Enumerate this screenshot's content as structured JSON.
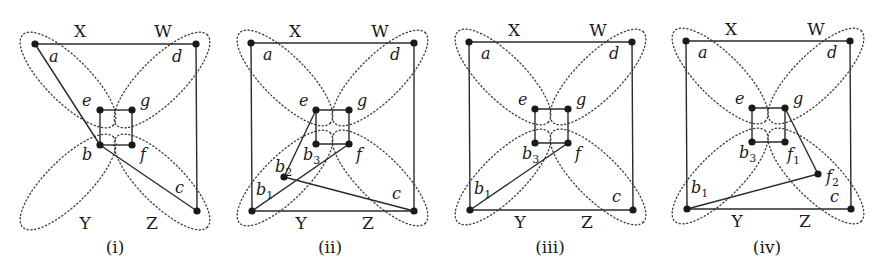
{
  "figure": {
    "panels": [
      {
        "id": "i",
        "caption": "(i)",
        "caption_pos": [
          115,
          253
        ],
        "regions": [
          {
            "label": "X",
            "pos": [
              80,
              37
            ]
          },
          {
            "label": "W",
            "pos": [
              163,
              37
            ]
          },
          {
            "label": "Y",
            "pos": [
              85,
              229
            ]
          },
          {
            "label": "Z",
            "pos": [
              152,
              229
            ]
          }
        ],
        "ellipses": [
          {
            "name": "X",
            "cx": 68,
            "cy": 80,
            "rx": 64,
            "ry": 22,
            "rot": 45
          },
          {
            "name": "W",
            "cx": 162,
            "cy": 80,
            "rx": 64,
            "ry": 22,
            "rot": -45
          },
          {
            "name": "Y",
            "cx": 68,
            "cy": 182,
            "rx": 64,
            "ry": 22,
            "rot": -45
          },
          {
            "name": "Z",
            "cx": 162,
            "cy": 182,
            "rx": 64,
            "ry": 22,
            "rot": 45
          }
        ],
        "vertices": [
          {
            "id": "a",
            "x": 35,
            "y": 44,
            "label": "a",
            "sub": "",
            "lx": 49,
            "ly": 62
          },
          {
            "id": "d",
            "x": 196,
            "y": 44,
            "label": "d",
            "sub": "",
            "lx": 172,
            "ly": 62
          },
          {
            "id": "e",
            "x": 100,
            "y": 110,
            "label": "e",
            "sub": "",
            "lx": 82,
            "ly": 106
          },
          {
            "id": "g",
            "x": 132,
            "y": 110,
            "label": "g",
            "sub": "",
            "lx": 140,
            "ly": 106
          },
          {
            "id": "b",
            "x": 100,
            "y": 145,
            "label": "b",
            "sub": "",
            "lx": 82,
            "ly": 160
          },
          {
            "id": "f",
            "x": 132,
            "y": 145,
            "label": "f",
            "sub": "",
            "lx": 140,
            "ly": 160
          },
          {
            "id": "c",
            "x": 197,
            "y": 211,
            "label": "c",
            "sub": "",
            "lx": 175,
            "ly": 193
          }
        ],
        "edges": [
          [
            "a",
            "d"
          ],
          [
            "d",
            "c"
          ],
          [
            "a",
            "b"
          ],
          [
            "b",
            "c"
          ],
          [
            "e",
            "g"
          ],
          [
            "g",
            "f"
          ],
          [
            "f",
            "b"
          ],
          [
            "b",
            "e"
          ]
        ]
      },
      {
        "id": "ii",
        "caption": "(ii)",
        "caption_pos": [
          330,
          253
        ],
        "regions": [
          {
            "label": "X",
            "pos": [
              295,
              37
            ]
          },
          {
            "label": "W",
            "pos": [
              380,
              37
            ]
          },
          {
            "label": "Y",
            "pos": [
              301,
              229
            ]
          },
          {
            "label": "Z",
            "pos": [
              368,
              229
            ]
          }
        ],
        "ellipses": [
          {
            "name": "X",
            "cx": 285,
            "cy": 78,
            "rx": 64,
            "ry": 22,
            "rot": 45
          },
          {
            "name": "W",
            "cx": 380,
            "cy": 78,
            "rx": 64,
            "ry": 22,
            "rot": -45
          },
          {
            "name": "Y",
            "cx": 285,
            "cy": 178,
            "rx": 64,
            "ry": 22,
            "rot": -45
          },
          {
            "name": "Z",
            "cx": 380,
            "cy": 178,
            "rx": 64,
            "ry": 22,
            "rot": 45
          }
        ],
        "vertices": [
          {
            "id": "a",
            "x": 251,
            "y": 43,
            "label": "a",
            "sub": "",
            "lx": 263,
            "ly": 60
          },
          {
            "id": "d",
            "x": 414,
            "y": 43,
            "label": "d",
            "sub": "",
            "lx": 390,
            "ly": 60
          },
          {
            "id": "e",
            "x": 316,
            "y": 110,
            "label": "e",
            "sub": "",
            "lx": 299,
            "ly": 106
          },
          {
            "id": "g",
            "x": 349,
            "y": 110,
            "label": "g",
            "sub": "",
            "lx": 357,
            "ly": 106
          },
          {
            "id": "b3",
            "x": 316,
            "y": 144,
            "label": "b",
            "sub": "3",
            "lx": 303,
            "ly": 160
          },
          {
            "id": "f",
            "x": 349,
            "y": 144,
            "label": "f",
            "sub": "",
            "lx": 356,
            "ly": 160
          },
          {
            "id": "b2",
            "x": 284,
            "y": 177,
            "label": "b",
            "sub": "2",
            "lx": 275,
            "ly": 172
          },
          {
            "id": "b1",
            "x": 252,
            "y": 211,
            "label": "b",
            "sub": "1",
            "lx": 256,
            "ly": 195
          },
          {
            "id": "c",
            "x": 414,
            "y": 211,
            "label": "c",
            "sub": "",
            "lx": 392,
            "ly": 199
          }
        ],
        "edges": [
          [
            "a",
            "d"
          ],
          [
            "d",
            "c"
          ],
          [
            "a",
            "b1"
          ],
          [
            "b1",
            "c"
          ],
          [
            "e",
            "g"
          ],
          [
            "g",
            "f"
          ],
          [
            "f",
            "b3"
          ],
          [
            "b3",
            "e"
          ],
          [
            "e",
            "b2"
          ],
          [
            "b2",
            "c"
          ],
          [
            "b1",
            "f"
          ]
        ]
      },
      {
        "id": "iii",
        "caption": "(iii)",
        "caption_pos": [
          550,
          253
        ],
        "regions": [
          {
            "label": "X",
            "pos": [
              514,
              36
            ]
          },
          {
            "label": "W",
            "pos": [
              598,
              36
            ]
          },
          {
            "label": "Y",
            "pos": [
              520,
              228
            ]
          },
          {
            "label": "Z",
            "pos": [
              587,
              228
            ]
          }
        ],
        "ellipses": [
          {
            "name": "X",
            "cx": 503,
            "cy": 77,
            "rx": 64,
            "ry": 22,
            "rot": 45
          },
          {
            "name": "W",
            "cx": 598,
            "cy": 77,
            "rx": 64,
            "ry": 22,
            "rot": -45
          },
          {
            "name": "Y",
            "cx": 503,
            "cy": 177,
            "rx": 64,
            "ry": 22,
            "rot": -45
          },
          {
            "name": "Z",
            "cx": 598,
            "cy": 177,
            "rx": 64,
            "ry": 22,
            "rot": 45
          }
        ],
        "vertices": [
          {
            "id": "a",
            "x": 469,
            "y": 42,
            "label": "a",
            "sub": "",
            "lx": 481,
            "ly": 59
          },
          {
            "id": "d",
            "x": 632,
            "y": 42,
            "label": "d",
            "sub": "",
            "lx": 609,
            "ly": 59
          },
          {
            "id": "e",
            "x": 535,
            "y": 109,
            "label": "e",
            "sub": "",
            "lx": 518,
            "ly": 105
          },
          {
            "id": "g",
            "x": 568,
            "y": 109,
            "label": "g",
            "sub": "",
            "lx": 576,
            "ly": 105
          },
          {
            "id": "b3",
            "x": 535,
            "y": 143,
            "label": "b",
            "sub": "3",
            "lx": 522,
            "ly": 159
          },
          {
            "id": "f",
            "x": 568,
            "y": 143,
            "label": "f",
            "sub": "",
            "lx": 575,
            "ly": 159
          },
          {
            "id": "b1",
            "x": 470,
            "y": 210,
            "label": "b",
            "sub": "1",
            "lx": 474,
            "ly": 194
          },
          {
            "id": "c",
            "x": 633,
            "y": 210,
            "label": "c",
            "sub": "",
            "lx": 612,
            "ly": 202
          }
        ],
        "edges": [
          [
            "a",
            "d"
          ],
          [
            "d",
            "c"
          ],
          [
            "a",
            "b1"
          ],
          [
            "b1",
            "c"
          ],
          [
            "e",
            "g"
          ],
          [
            "g",
            "f"
          ],
          [
            "f",
            "b3"
          ],
          [
            "b3",
            "e"
          ],
          [
            "b1",
            "f"
          ]
        ]
      },
      {
        "id": "iv",
        "caption": "(iv)",
        "caption_pos": [
          767,
          253
        ],
        "regions": [
          {
            "label": "X",
            "pos": [
              731,
              35
            ]
          },
          {
            "label": "W",
            "pos": [
              816,
              35
            ]
          },
          {
            "label": "Y",
            "pos": [
              737,
              227
            ]
          },
          {
            "label": "Z",
            "pos": [
              805,
              227
            ]
          }
        ],
        "ellipses": [
          {
            "name": "X",
            "cx": 720,
            "cy": 76,
            "rx": 64,
            "ry": 22,
            "rot": 45
          },
          {
            "name": "W",
            "cx": 816,
            "cy": 76,
            "rx": 64,
            "ry": 22,
            "rot": -45
          },
          {
            "name": "Y",
            "cx": 720,
            "cy": 176,
            "rx": 64,
            "ry": 22,
            "rot": -45
          },
          {
            "name": "Z",
            "cx": 816,
            "cy": 176,
            "rx": 64,
            "ry": 22,
            "rot": 45
          }
        ],
        "vertices": [
          {
            "id": "a",
            "x": 686,
            "y": 41,
            "label": "a",
            "sub": "",
            "lx": 698,
            "ly": 58
          },
          {
            "id": "d",
            "x": 850,
            "y": 41,
            "label": "d",
            "sub": "",
            "lx": 827,
            "ly": 58
          },
          {
            "id": "e",
            "x": 752,
            "y": 108,
            "label": "e",
            "sub": "",
            "lx": 735,
            "ly": 104
          },
          {
            "id": "g",
            "x": 785,
            "y": 108,
            "label": "g",
            "sub": "",
            "lx": 793,
            "ly": 104
          },
          {
            "id": "b3",
            "x": 752,
            "y": 142,
            "label": "b",
            "sub": "3",
            "lx": 739,
            "ly": 158
          },
          {
            "id": "f1",
            "x": 785,
            "y": 142,
            "label": "f",
            "sub": "1",
            "lx": 787,
            "ly": 160
          },
          {
            "id": "f2",
            "x": 818,
            "y": 174,
            "label": "f",
            "sub": "2",
            "lx": 826,
            "ly": 182
          },
          {
            "id": "b1",
            "x": 687,
            "y": 209,
            "label": "b",
            "sub": "1",
            "lx": 691,
            "ly": 193
          },
          {
            "id": "c",
            "x": 851,
            "y": 209,
            "label": "c",
            "sub": "",
            "lx": 830,
            "ly": 202
          }
        ],
        "edges": [
          [
            "a",
            "d"
          ],
          [
            "d",
            "c"
          ],
          [
            "a",
            "b1"
          ],
          [
            "b1",
            "c"
          ],
          [
            "e",
            "g"
          ],
          [
            "g",
            "f1"
          ],
          [
            "f1",
            "b3"
          ],
          [
            "b3",
            "e"
          ],
          [
            "g",
            "f2"
          ],
          [
            "f2",
            "b1"
          ]
        ]
      }
    ]
  }
}
